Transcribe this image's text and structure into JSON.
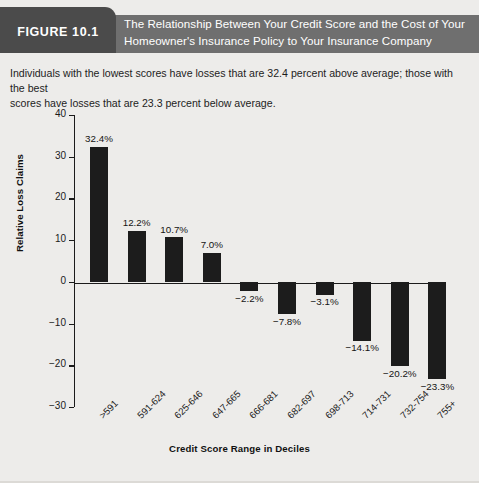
{
  "header": {
    "figure_tab": "FIGURE 10.1",
    "title_line1": "The Relationship Between Your Credit Score and the Cost of Your",
    "title_line2": "Homeowner's Insurance Policy to Your Insurance Company",
    "banner_color": "#6f6f6f",
    "tab_color": "#4b4b4b"
  },
  "caption": {
    "line1": "Individuals with the lowest scores have losses that are 32.4 percent above average; those with the best",
    "line2": "scores have losses that are 23.3 percent below average."
  },
  "chart_data": {
    "type": "bar",
    "title": "The Relationship Between Your Credit Score and the Cost of Your Homeowner's Insurance Policy to Your Insurance Company",
    "xlabel": "Credit Score Range in Deciles",
    "ylabel": "Relative Loss Claims",
    "categories": [
      ">591",
      "591-624",
      "625-646",
      "647-665",
      "666-681",
      "682-697",
      "698-713",
      "714-731",
      "732-754",
      "755+"
    ],
    "values": [
      32.4,
      12.2,
      10.7,
      7.0,
      -2.2,
      -7.8,
      -3.1,
      -14.1,
      -20.2,
      -23.3
    ],
    "data_labels": [
      "32.4%",
      "12.2%",
      "10.7%",
      "7.0%",
      "−2.2%",
      "−7.8%",
      "−3.1%",
      "−14.1%",
      "−20.2%",
      "−23.3%"
    ],
    "ylim": [
      -30,
      40
    ],
    "yticks": [
      40,
      30,
      20,
      10,
      0,
      -10,
      -20,
      -30
    ],
    "ytick_labels": [
      "40",
      "30",
      "20",
      "10",
      "0",
      "−10",
      "−20",
      "−30"
    ],
    "grid": false,
    "legend": false,
    "bar_color": "#1c1c1c",
    "background_color": "#edecea"
  }
}
